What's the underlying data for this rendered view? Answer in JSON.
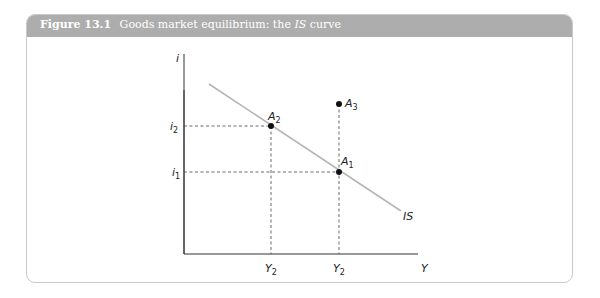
{
  "figure": {
    "number_label": "Figure 13.1",
    "title_prefix": "Goods market equilibrium: the",
    "title_italic": "IS",
    "title_suffix": "curve",
    "header_color": "#adadad"
  },
  "diagram": {
    "axes": {
      "y_axis_label": "i",
      "x_axis_label": "Y"
    },
    "curve": {
      "label": "IS",
      "color": "#b5b5b5"
    },
    "points": [
      {
        "id": "A2",
        "label": "A",
        "sub": "2"
      },
      {
        "id": "A3",
        "label": "A",
        "sub": "3"
      },
      {
        "id": "A1",
        "label": "A",
        "sub": "1"
      }
    ],
    "y_ticks": [
      {
        "label": "i",
        "sub": "2"
      },
      {
        "label": "i",
        "sub": "1"
      }
    ],
    "x_ticks": [
      {
        "label": "Y",
        "sub": "2"
      },
      {
        "label": "Y",
        "sub": "2"
      }
    ]
  }
}
